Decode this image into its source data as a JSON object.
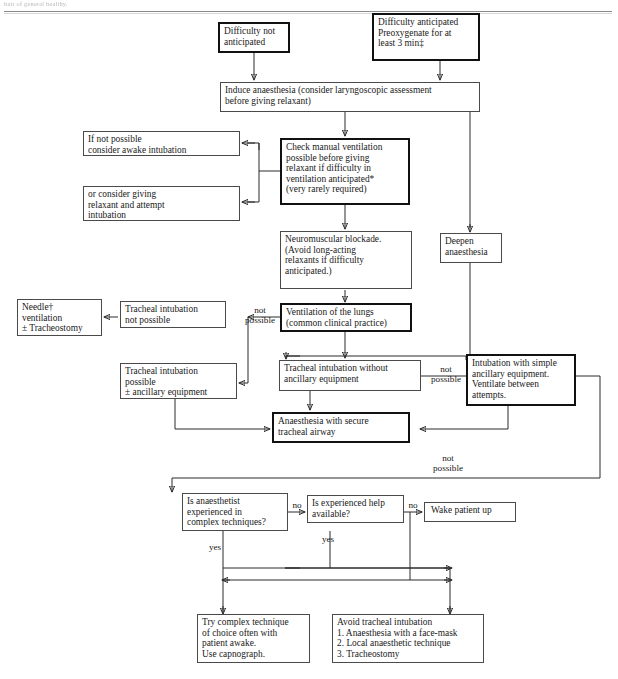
{
  "page": {
    "top_fragment": "hair of general healthy.",
    "bg_color": "#ffffff",
    "line_color": "#2b2b2b",
    "text_color": "#1a1a1a"
  },
  "nodes": {
    "difficulty_not_anticipated": {
      "label": "Difficulty not\nanticipated",
      "emphasis": "bold"
    },
    "difficulty_anticipated": {
      "label": "Difficulty anticipated\nPreoxygenate for at\nleast 3 min‡",
      "emphasis": "bold"
    },
    "induce_anaesthesia": {
      "label": "Induce anaesthesia (consider laryngoscopic assessment\nbefore giving relaxant)",
      "emphasis": "normal"
    },
    "if_not_possible_awake": {
      "label": "If not possible\nconsider awake intubation",
      "emphasis": "normal"
    },
    "or_consider_giving": {
      "label": "or consider giving\nrelaxant and attempt\nintubation",
      "emphasis": "normal"
    },
    "check_manual_ventilation": {
      "label": "Check manual ventilation\npossible before giving\nrelaxant if difficulty in\nventilation anticipated*\n(very rarely required)",
      "emphasis": "bold"
    },
    "neuromuscular_blockade": {
      "label": "Neuromuscular blockade.\n(Avoid long-acting\nrelaxants if difficulty\nanticipated.)",
      "emphasis": "normal"
    },
    "deepen_anaesthesia": {
      "label": "Deepen\nanaesthesia",
      "emphasis": "normal"
    },
    "needle_ventilation": {
      "label": "Needle†\nventilation\n± Tracheostomy",
      "emphasis": "normal"
    },
    "tracheal_intubation_not_possible": {
      "label": "Tracheal intubation\nnot possible",
      "emphasis": "normal"
    },
    "ventilation_of_lungs": {
      "label": "Ventilation of the lungs\n(common clinical practice)",
      "emphasis": "bold"
    },
    "tracheal_intubation_possible": {
      "label": "Tracheal intubation\npossible\n± ancillary equipment",
      "emphasis": "normal"
    },
    "tracheal_intubation_without": {
      "label": "Tracheal intubation without\nancillary equipment",
      "emphasis": "normal"
    },
    "intubation_with_simple": {
      "label": "Intubation with simple\nancillary equipment.\nVentilate between\nattempts.",
      "emphasis": "bold"
    },
    "anaesthesia_secure_airway": {
      "label": "Anaesthesia with secure\ntracheal airway",
      "emphasis": "bold"
    },
    "is_anaesthetist_experienced": {
      "label": "Is anaesthetist\nexperienced in\ncomplex techniques?",
      "emphasis": "normal"
    },
    "is_experienced_help": {
      "label": "Is experienced help\navailable?",
      "emphasis": "normal"
    },
    "wake_patient_up": {
      "label": "Wake patient up",
      "emphasis": "normal"
    },
    "try_complex_technique": {
      "label": "Try complex technique\nof choice often with\npatient awake.\nUse capnograph.",
      "emphasis": "normal"
    },
    "avoid_tracheal_intubation": {
      "label": "Avoid tracheal intubation\n1. Anaesthesia with a face-mask\n2. Local anaesthetic technique\n3. Tracheostomy",
      "emphasis": "normal"
    }
  },
  "edge_labels": {
    "not_possible_1": "not\npossible",
    "not_possible_2": "not\npossible",
    "not_possible_3": "not\npossible",
    "no_1": "no",
    "no_2": "no",
    "yes_1": "yes",
    "yes_2": "yes"
  }
}
